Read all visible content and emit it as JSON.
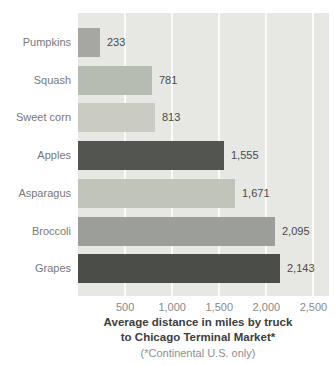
{
  "caption": {
    "line1": "Average distance in miles by truck",
    "line2": "to Chicago Terminal Market*",
    "footnote": "(*Continental U.S. only)"
  },
  "chart_data": {
    "type": "bar",
    "orientation": "horizontal",
    "title": "Average distance in miles by truck to Chicago Terminal Market*",
    "footnote": "(*Continental U.S. only)",
    "categories": [
      "Pumpkins",
      "Squash",
      "Sweet corn",
      "Apples",
      "Asparagus",
      "Broccoli",
      "Grapes"
    ],
    "values": [
      233,
      781,
      813,
      1555,
      1671,
      2095,
      2143
    ],
    "value_labels": [
      "233",
      "781",
      "813",
      "1,555",
      "1,671",
      "2,095",
      "2,143"
    ],
    "bar_colors": [
      "#a6a7a3",
      "#b7bcb0",
      "#caccc4",
      "#535550",
      "#c1c5b9",
      "#9c9e99",
      "#4b4d49"
    ],
    "xlim": [
      0,
      2665
    ],
    "xticks": [
      500,
      1000,
      1500,
      2000,
      2500
    ],
    "xtick_labels": [
      "500",
      "1,000",
      "1,500",
      "2,000",
      "2,500"
    ],
    "grid": true,
    "gridline_color": "#fbfbfa",
    "plot_background": "#e7e7e4",
    "legend": "none",
    "colors": {
      "category_label": "#787878",
      "value_label": "#4a4a4a",
      "tick_label": "#8a8a8a",
      "caption": "#3d3d3d",
      "footnote": "#8f8f8f"
    }
  }
}
